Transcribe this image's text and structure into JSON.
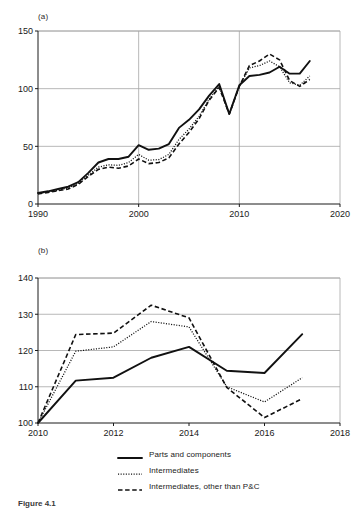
{
  "figure": {
    "caption": "Figure 4.1",
    "panel_a_label": "(a)",
    "panel_b_label": "(b)"
  },
  "legend": {
    "position": "bottom-center",
    "items": [
      {
        "label": "Parts and components",
        "style": "solid",
        "color": "#111111"
      },
      {
        "label": "Intermediates",
        "style": "dotted",
        "color": "#111111"
      },
      {
        "label": "Intermediates, other than P&C",
        "style": "dashed",
        "color": "#111111"
      }
    ]
  },
  "chart_data": [
    {
      "id": "panel-a",
      "type": "line",
      "title": "(a)",
      "xlabel": "",
      "ylabel": "",
      "xlim": [
        1990,
        2020
      ],
      "ylim": [
        0,
        150
      ],
      "xticks": [
        1990,
        2000,
        2010,
        2020
      ],
      "yticks": [
        0,
        50,
        100,
        150
      ],
      "grid": "horizontal-and-vertical",
      "x": [
        1990,
        1991,
        1992,
        1993,
        1994,
        1995,
        1996,
        1997,
        1998,
        1999,
        2000,
        2001,
        2002,
        2003,
        2004,
        2005,
        2006,
        2007,
        2008,
        2009,
        2010,
        2011,
        2012,
        2013,
        2014,
        2015,
        2016,
        2017
      ],
      "series": [
        {
          "name": "Parts and components",
          "style": "solid",
          "values": [
            9.5,
            11,
            13,
            15,
            19,
            27,
            36,
            39,
            39,
            41,
            51,
            47,
            48,
            52,
            66,
            73,
            82,
            94,
            104,
            78,
            103,
            111,
            112,
            114,
            119,
            113,
            113,
            124
          ]
        },
        {
          "name": "Intermediates",
          "style": "dotted",
          "values": [
            9,
            10.5,
            12,
            14,
            18,
            25,
            32,
            34,
            33.5,
            36,
            43,
            38,
            38.5,
            43,
            56,
            65,
            76,
            91,
            102,
            78,
            102,
            118,
            120,
            124,
            119,
            105,
            103,
            111
          ]
        },
        {
          "name": "Intermediates, other than P&C",
          "style": "dashed",
          "values": [
            8.8,
            10,
            11.5,
            13,
            17,
            24,
            30,
            32,
            31,
            33,
            39,
            35,
            36,
            40,
            52,
            62,
            74,
            90,
            101,
            78,
            102,
            120,
            124,
            130,
            125,
            107,
            102,
            108
          ]
        }
      ]
    },
    {
      "id": "panel-b",
      "type": "line",
      "title": "(b)",
      "xlabel": "",
      "ylabel": "",
      "xlim": [
        2010,
        2018
      ],
      "ylim": [
        100,
        140
      ],
      "xticks": [
        2010,
        2012,
        2014,
        2016,
        2018
      ],
      "yticks": [
        100,
        110,
        120,
        130,
        140
      ],
      "grid": "horizontal",
      "x": [
        2010,
        2011,
        2012,
        2013,
        2014,
        2015,
        2016,
        2017
      ],
      "series": [
        {
          "name": "Parts and components",
          "style": "solid",
          "values": [
            100,
            111.7,
            112.5,
            118,
            121,
            114.4,
            113.8,
            124.5
          ]
        },
        {
          "name": "Intermediates",
          "style": "dotted",
          "values": [
            100,
            119.8,
            121,
            128,
            126.5,
            110,
            105.8,
            112.5
          ]
        },
        {
          "name": "Intermediates, other than P&C",
          "style": "dashed",
          "values": [
            100,
            124.4,
            124.8,
            132.5,
            129,
            109.8,
            101.5,
            106.7
          ]
        }
      ]
    }
  ]
}
